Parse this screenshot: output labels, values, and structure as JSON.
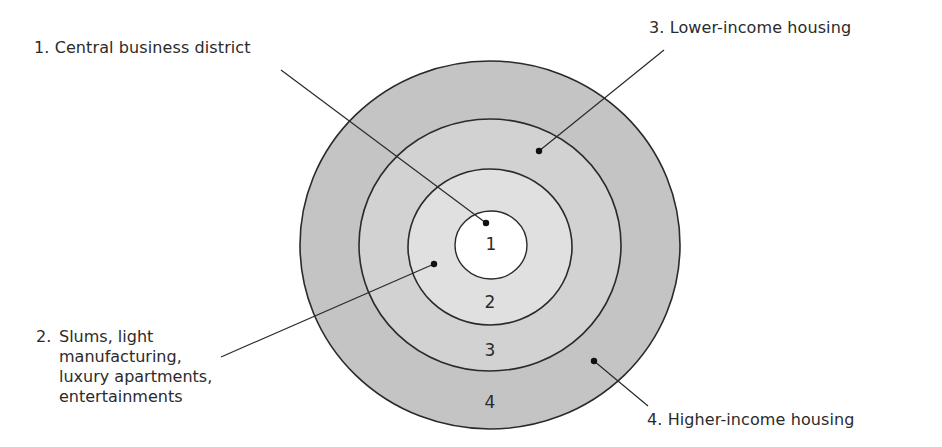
{
  "diagram": {
    "colors": {
      "ring_4_fill": "#c4c4c4",
      "ring_3_fill": "#d2d2d2",
      "ring_2_fill": "#e0e0e0",
      "ring_1_fill": "#ffffff",
      "stroke": "#2a2a2a",
      "text": "#2b2b2b"
    },
    "rings": [
      {
        "number": "1",
        "name": "Central business district"
      },
      {
        "number": "2",
        "name": "Slums, light manufacturing, luxury apartments, entertainments"
      },
      {
        "number": "3",
        "name": "Lower-income housing"
      },
      {
        "number": "4",
        "name": "Higher-income housing"
      }
    ],
    "labels": {
      "zone1": "1. Central business district",
      "zone2_number": "2.",
      "zone2_lines": [
        "Slums, light",
        "manufacturing,",
        "luxury apartments,",
        "entertainments"
      ],
      "zone3": "3. Lower-income housing",
      "zone4": "4. Higher-income housing"
    }
  }
}
